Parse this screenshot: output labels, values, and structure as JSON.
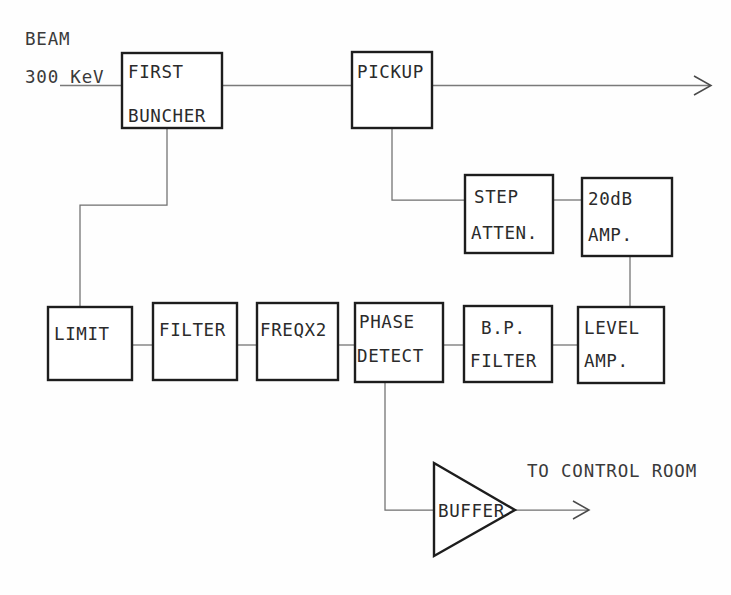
{
  "diagram": {
    "type": "block-diagram",
    "canvas": {
      "width": 731,
      "height": 595
    },
    "colors": {
      "background": "#fefefe",
      "box_stroke": "#1d1d1d",
      "wire_stroke": "#6f6f6f",
      "text": "#2b2b2b"
    },
    "annotations": {
      "beam": "BEAM",
      "energy": "300 KeV",
      "output": "TO CONTROL ROOM"
    },
    "blocks": {
      "first_buncher": {
        "line1": "FIRST",
        "line2": "BUNCHER"
      },
      "pickup": {
        "line1": "PICKUP"
      },
      "step_atten": {
        "line1": "STEP",
        "line2": "ATTEN."
      },
      "amp_20db": {
        "line1": "20dB",
        "line2": "AMP."
      },
      "limit": {
        "line1": "LIMIT"
      },
      "filter": {
        "line1": "FILTER"
      },
      "freqx2": {
        "line1": "FREQX2"
      },
      "phase_detect": {
        "line1": "PHASE",
        "line2": "DETECT"
      },
      "bp_filter": {
        "line1": "B.P.",
        "line2": "FILTER"
      },
      "level_amp": {
        "line1": "LEVEL",
        "line2": "AMP."
      },
      "buffer": {
        "line1": "BUFFER"
      }
    }
  }
}
